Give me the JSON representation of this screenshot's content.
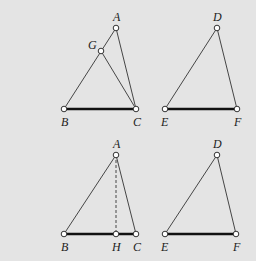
{
  "figure": {
    "background": "#e4e4e4",
    "panels": [
      {
        "id": "top-left",
        "points": {
          "A": {
            "x": 116,
            "y": 28,
            "label": "A",
            "lx": 113,
            "ly": 21
          },
          "G": {
            "x": 101,
            "y": 51,
            "label": "G",
            "lx": 88,
            "ly": 49
          },
          "B": {
            "x": 64,
            "y": 109,
            "label": "B",
            "lx": 61,
            "ly": 126
          },
          "C": {
            "x": 136,
            "y": 109,
            "label": "C",
            "lx": 133,
            "ly": 126
          }
        },
        "segments": [
          {
            "from": "A",
            "to": "B",
            "style": "edge"
          },
          {
            "from": "A",
            "to": "C",
            "style": "edge"
          },
          {
            "from": "G",
            "to": "C",
            "style": "edge"
          },
          {
            "from": "B",
            "to": "C",
            "style": "base"
          }
        ]
      },
      {
        "id": "top-right",
        "points": {
          "D": {
            "x": 217,
            "y": 28,
            "label": "D",
            "lx": 213,
            "ly": 21
          },
          "E": {
            "x": 165,
            "y": 109,
            "label": "E",
            "lx": 161,
            "ly": 126
          },
          "F": {
            "x": 237,
            "y": 109,
            "label": "F",
            "lx": 234,
            "ly": 126
          }
        },
        "segments": [
          {
            "from": "D",
            "to": "E",
            "style": "edge"
          },
          {
            "from": "D",
            "to": "F",
            "style": "edge"
          },
          {
            "from": "E",
            "to": "F",
            "style": "base"
          }
        ]
      },
      {
        "id": "bottom-left",
        "points": {
          "A": {
            "x": 116,
            "y": 155,
            "label": "A",
            "lx": 113,
            "ly": 148
          },
          "B": {
            "x": 64,
            "y": 234,
            "label": "B",
            "lx": 61,
            "ly": 251
          },
          "H": {
            "x": 116,
            "y": 234,
            "label": "H",
            "lx": 112,
            "ly": 251
          },
          "C": {
            "x": 136,
            "y": 234,
            "label": "C",
            "lx": 133,
            "ly": 251
          }
        },
        "segments": [
          {
            "from": "A",
            "to": "B",
            "style": "edge"
          },
          {
            "from": "A",
            "to": "C",
            "style": "edge"
          },
          {
            "from": "A",
            "to": "H",
            "style": "dash"
          },
          {
            "from": "B",
            "to": "C",
            "style": "base"
          }
        ]
      },
      {
        "id": "bottom-right",
        "points": {
          "D": {
            "x": 217,
            "y": 155,
            "label": "D",
            "lx": 213,
            "ly": 148
          },
          "E": {
            "x": 165,
            "y": 234,
            "label": "E",
            "lx": 161,
            "ly": 251
          },
          "F": {
            "x": 236,
            "y": 234,
            "label": "F",
            "lx": 233,
            "ly": 251
          }
        },
        "segments": [
          {
            "from": "D",
            "to": "E",
            "style": "edge"
          },
          {
            "from": "D",
            "to": "F",
            "style": "edge"
          },
          {
            "from": "E",
            "to": "F",
            "style": "base"
          }
        ]
      }
    ]
  }
}
